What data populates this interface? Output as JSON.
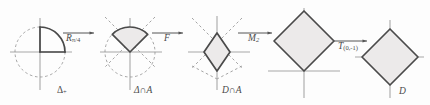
{
  "figure": {
    "title": "",
    "background": "#fdfdfd",
    "stroke_solid": "#4a4a4a",
    "stroke_axis": "#a8a8a8",
    "stroke_dashed": "#9a9a9a",
    "shade_fill": "#eceaea"
  },
  "panels": [
    {
      "id": "panel-1",
      "base_label": "Δ",
      "base_label_sub": "+",
      "shape": "quarter-disc",
      "description": "dashed unit circle with solid quarter arc in first quadrant"
    },
    {
      "id": "panel-2",
      "base_label": "Δ∩A",
      "base_label_sub": "",
      "shape": "sector",
      "description": "dashed unit circle with solid sector from 45 to 135 degrees"
    },
    {
      "id": "panel-3",
      "base_label": "D∩A",
      "base_label_sub": "",
      "shape": "small-diamond",
      "description": "small solid diamond above x axis with dashed diagonals"
    },
    {
      "id": "panel-4",
      "base_label": "",
      "base_label_sub": "",
      "shape": "large-diamond-above",
      "description": "large shaded diamond with bottom vertex at origin"
    },
    {
      "id": "panel-5",
      "base_label": "D",
      "base_label_sub": "",
      "shape": "large-diamond-centered",
      "description": "large shaded diamond centered at origin"
    }
  ],
  "arrows": [
    {
      "id": "arrow-1",
      "label_main": "R",
      "label_sub": "π/4",
      "full": "Rπ/4"
    },
    {
      "id": "arrow-2",
      "label_main": "F",
      "label_sub": "",
      "full": "F"
    },
    {
      "id": "arrow-3",
      "label_main": "M",
      "label_sub": "2",
      "full": "M2"
    },
    {
      "id": "arrow-4",
      "label_main": "T",
      "label_sub": "(0,-1)",
      "full": "T(0,-1)"
    }
  ]
}
